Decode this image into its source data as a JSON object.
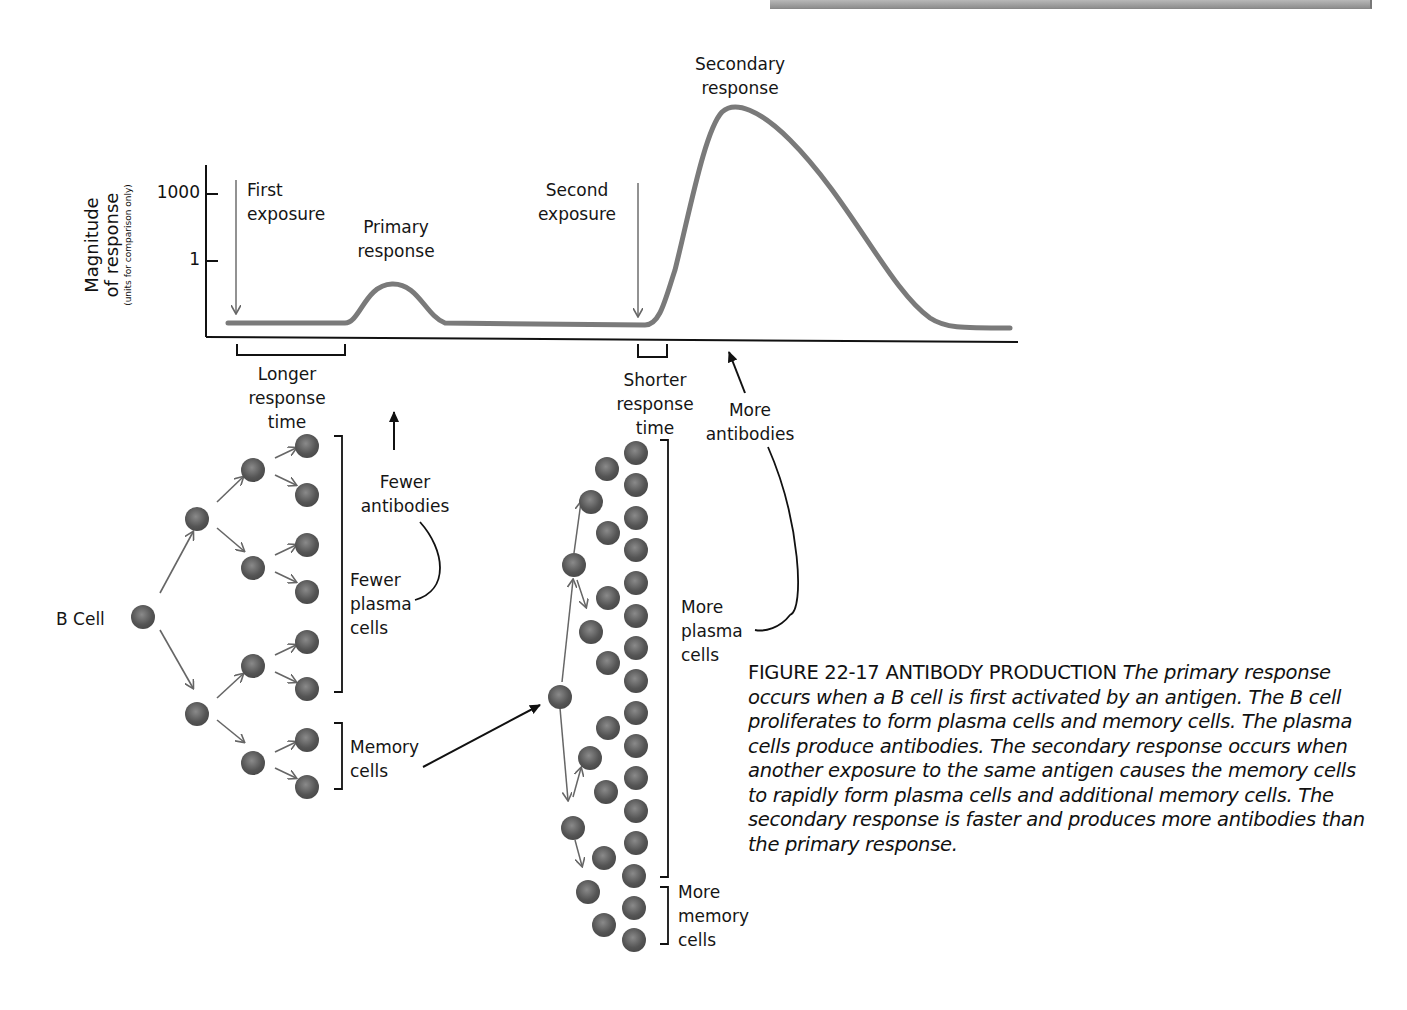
{
  "figure": {
    "number": "FIGURE 22-17",
    "title": "ANTIBODY PRODUCTION",
    "caption_body": "The primary response occurs when a B cell is first activated by an antigen. The B cell proliferates to form plasma cells and memory cells. The plasma cells produce antibodies. The secondary response occurs when another exposure to the same antigen causes the memory cells to rapidly form plasma cells and additional memory cells. The secondary response is faster and produces more antibodies than the primary response."
  },
  "graph": {
    "y_axis_title": "Magnitude of response",
    "y_axis_title_line1": "Magnitude",
    "y_axis_title_line2": "of response",
    "y_axis_subtitle": "(units for comparison only)",
    "y_ticks": [
      "1000",
      "1"
    ],
    "annotations": {
      "first_exposure": [
        "First",
        "exposure"
      ],
      "primary_response": [
        "Primary",
        "response"
      ],
      "second_exposure": [
        "Second",
        "exposure"
      ],
      "secondary_response": [
        "Secondary",
        "response"
      ],
      "longer_response_time": [
        "Longer",
        "response",
        "time"
      ],
      "shorter_response_time": [
        "Shorter",
        "response",
        "time"
      ],
      "fewer_antibodies": [
        "Fewer",
        "antibodies"
      ],
      "more_antibodies": [
        "More",
        "antibodies"
      ]
    },
    "curve_color": "#7a7a7a",
    "axis_color": "#111111"
  },
  "primary_branch": {
    "b_cell_label": "B Cell",
    "plasma_label": [
      "Fewer",
      "plasma",
      "cells"
    ],
    "memory_label": [
      "Memory",
      "cells"
    ]
  },
  "secondary_branch": {
    "plasma_label": [
      "More",
      "plasma",
      "cells"
    ],
    "memory_label": [
      "More",
      "memory",
      "cells"
    ]
  },
  "cell_color": "#5a5a5a"
}
